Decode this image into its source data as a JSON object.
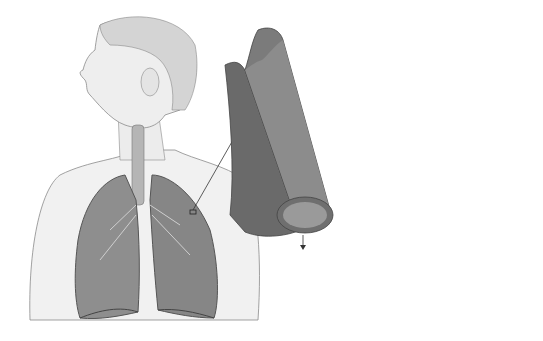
{
  "panels": {
    "A": {
      "letter": "A",
      "labels": {
        "airways": "Airways",
        "lungs": "Lungs"
      }
    },
    "B": {
      "letter": "B",
      "title": "Normal\nAirway",
      "labels": {
        "muscle": "Muscle",
        "airway_walls": "Airway\nwalls"
      },
      "inset": {
        "muscle": "Muscle",
        "airway_wall": "Airway\nwall",
        "caption": "Airway x-section"
      }
    },
    "C": {
      "letter": "C",
      "title": "During Asthma\nSymptoms",
      "labels": {
        "narrowed": "Narrowed\nairway\n(limited\nair flow)",
        "tightened": "Tightened\nmuscles\nconstrict\nairway",
        "inflamed": "Inflamed/\nthickened\nairway wall",
        "mucus": "Mucus"
      },
      "inset": {
        "thickened": "Thickened\nairway wall",
        "muscle": "Muscle",
        "mucus": "Mucus"
      }
    }
  },
  "colors": {
    "skin": "#eeeeee",
    "outline": "#6a6a6a",
    "lung": "#8a8a8a",
    "lung_dark": "#5e5e5e",
    "airway_muscle": "#5a5a5a",
    "airway_inner": "#9c9c9c",
    "inset_bg": "#e6e6e6"
  }
}
